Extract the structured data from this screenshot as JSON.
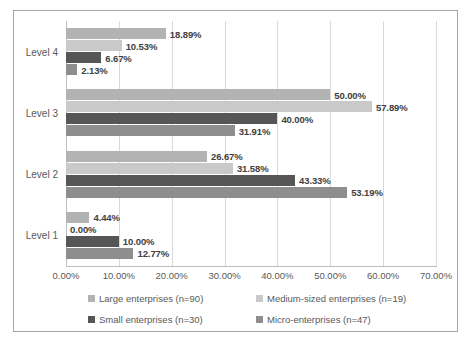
{
  "chart_data": {
    "type": "bar",
    "orientation": "horizontal",
    "title": "",
    "xlabel": "",
    "ylabel": "",
    "xlim": [
      0,
      70
    ],
    "xticks": [
      "0.00%",
      "10.00%",
      "20.00%",
      "30.00%",
      "40.00%",
      "50.00%",
      "60.00%",
      "70.00%"
    ],
    "xtick_values": [
      0,
      10,
      20,
      30,
      40,
      50,
      60,
      70
    ],
    "grid": true,
    "legend_position": "bottom",
    "categories": [
      "Level 1",
      "Level 2",
      "Level 3",
      "Level 4"
    ],
    "category_order_top_to_bottom": [
      "Level 4",
      "Level 3",
      "Level 2",
      "Level 1"
    ],
    "series": [
      {
        "name": "Large enterprises (n=90)",
        "color": "#b3b3b3",
        "values": [
          4.44,
          26.67,
          50.0,
          18.89
        ],
        "labels": [
          "4.44%",
          "26.67%",
          "50.00%",
          "18.89%"
        ]
      },
      {
        "name": "Medium-sized enterprises (n=19)",
        "color": "#c9c9c9",
        "values": [
          0.0,
          31.58,
          57.89,
          10.53
        ],
        "labels": [
          "0.00%",
          "31.58%",
          "57.89%",
          "10.53%"
        ]
      },
      {
        "name": "Small enterprises (n=30)",
        "color": "#565656",
        "values": [
          10.0,
          43.33,
          40.0,
          6.67
        ],
        "labels": [
          "10.00%",
          "43.33%",
          "40.00%",
          "6.67%"
        ]
      },
      {
        "name": "Micro-enterprises (n=47)",
        "color": "#8e8e8e",
        "values": [
          12.77,
          53.19,
          31.91,
          2.13
        ],
        "labels": [
          "12.77%",
          "53.19%",
          "31.91%",
          "2.13%"
        ]
      }
    ]
  },
  "axis": {
    "ticks": [
      {
        "label": "0.00%"
      },
      {
        "label": "10.00%"
      },
      {
        "label": "20.00%"
      },
      {
        "label": "30.00%"
      },
      {
        "label": "40.00%"
      },
      {
        "label": "50.00%"
      },
      {
        "label": "60.00%"
      },
      {
        "label": "70.00%"
      }
    ]
  },
  "categories": [
    {
      "label": "Level 4"
    },
    {
      "label": "Level 3"
    },
    {
      "label": "Level 2"
    },
    {
      "label": "Level 1"
    }
  ],
  "legend": {
    "items": [
      {
        "label": "Large enterprises (n=90)",
        "color": "#b3b3b3"
      },
      {
        "label": "Medium-sized enterprises (n=19)",
        "color": "#c9c9c9"
      },
      {
        "label": "Small enterprises (n=30)",
        "color": "#565656"
      },
      {
        "label": "Micro-enterprises (n=47)",
        "color": "#8e8e8e"
      }
    ]
  }
}
